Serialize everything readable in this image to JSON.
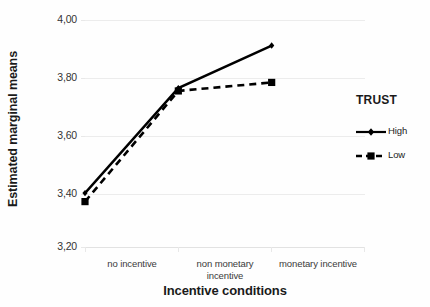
{
  "chart_data": {
    "type": "line",
    "title": "",
    "xlabel": "Incentive conditions",
    "ylabel": "Estimated marginal means",
    "categories": [
      "no incentive",
      "non monetary incentive",
      "monetary incentive"
    ],
    "category_lines": [
      [
        "no incentive"
      ],
      [
        "non monetary",
        "incentive"
      ],
      [
        "monetary incentive"
      ]
    ],
    "series": [
      {
        "name": "High",
        "values": [
          3.39,
          3.76,
          3.91
        ],
        "style": "solid",
        "marker": "diamond",
        "color": "#000000"
      },
      {
        "name": "Low",
        "values": [
          3.36,
          3.75,
          3.78
        ],
        "style": "dashed",
        "marker": "square",
        "color": "#000000"
      }
    ],
    "ylim": [
      3.2,
      4.0
    ],
    "yticks": [
      4.0,
      3.8,
      3.6,
      3.4,
      3.2
    ],
    "ytick_labels": [
      "4,00",
      "3,80",
      "3,60",
      "3,40",
      "3,20"
    ],
    "grid": "horizontal",
    "legend_position": "right",
    "legend_title": "TRUST"
  },
  "legend": {
    "title": "TRUST",
    "entries": [
      {
        "label": "High"
      },
      {
        "label": "Low"
      }
    ]
  },
  "axes": {
    "y_title": "Estimated marginal means",
    "x_title": "Incentive conditions"
  }
}
